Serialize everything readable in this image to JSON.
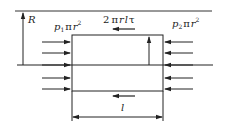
{
  "diagram": {
    "type": "free-body diagram of fluid cylinder in pipe",
    "colors": {
      "stroke": "#222222",
      "background": "#ffffff"
    },
    "labels": {
      "radius": "R",
      "left_force": {
        "p": "p",
        "sub": "1",
        "pi": "π",
        "r": "r",
        "sup": "2"
      },
      "right_force": {
        "p": "p",
        "sub": "2",
        "pi": "π",
        "r": "r",
        "sup": "2"
      },
      "shear_force": {
        "coef": "2",
        "pi": "π",
        "r": "r",
        "l": "l",
        "tau": "τ"
      },
      "length": "l"
    },
    "elements": [
      "pipe-wall-line",
      "centerline",
      "radius-arrow",
      "fluid-element-rectangle",
      "left-pressure-arrows (5)",
      "right-pressure-arrows (5)",
      "inner-radius-arrow",
      "top-shear-arrow",
      "bottom-shear-arrow",
      "length-dimension"
    ]
  }
}
